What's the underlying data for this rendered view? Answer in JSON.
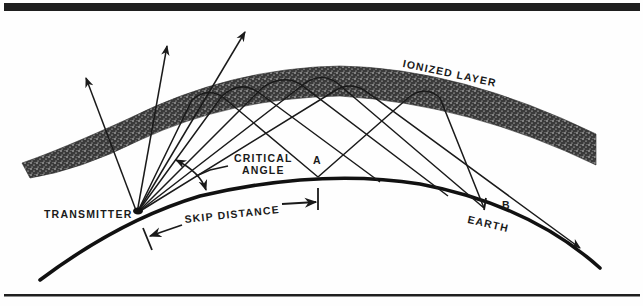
{
  "figure": {
    "type": "ionospheric-skip-propagation",
    "colors": {
      "ink": "#1a1a1a",
      "paper": "#fefefe",
      "layer_stipple": "#222222"
    }
  },
  "labels": {
    "ionized_layer": "IONIZED LAYER",
    "critical_angle_line1": "CRITICAL",
    "critical_angle_line2": "ANGLE",
    "point_a": "A",
    "point_b": "B",
    "transmitter": "TRANSMITTER",
    "skip_distance": "SKIP DISTANCE",
    "earth": "EARTH"
  },
  "elements": {
    "escaping_rays": 3,
    "reflected_rays": 6,
    "transmitter_point": [
      137,
      213
    ],
    "point_a": [
      318,
      177
    ],
    "point_b": [
      484,
      208
    ]
  }
}
